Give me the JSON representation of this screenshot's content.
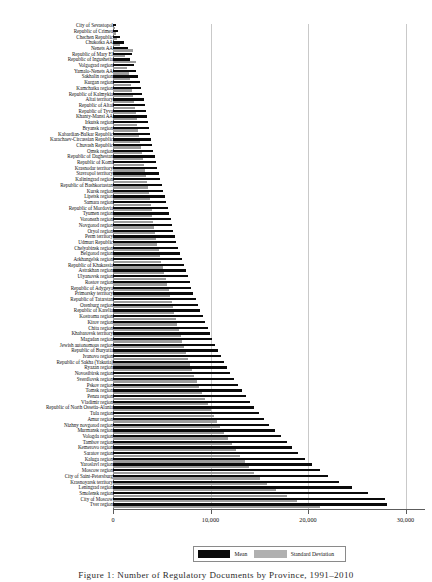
{
  "figure": {
    "caption": "Figure 1:     Number  of Regulatory  Documents by Province, 1991–2010"
  },
  "legend": {
    "position": "bottom-center",
    "items": [
      {
        "label": "Mean",
        "color": "#0a0a0a",
        "name": "legend-item-mean"
      },
      {
        "label": "Standard Deviation",
        "color": "#b0b0b0",
        "name": "legend-item-standard-deviation"
      }
    ]
  },
  "chart_data": {
    "type": "bar",
    "orientation": "horizontal",
    "title": "",
    "xlabel": "",
    "ylabel": "",
    "xlim": [
      0,
      32000
    ],
    "xticks": [
      0,
      10000,
      20000,
      30000
    ],
    "xtick_labels": [
      "0",
      "10,000",
      "20,000",
      "30,000"
    ],
    "grid": "vertical",
    "series": [
      {
        "name": "Mean",
        "color": "#0a0a0a"
      },
      {
        "name": "Standard Deviation",
        "color": "#9c9c9c"
      }
    ],
    "categories": [
      "City of Sevastopol",
      "Republic of Crimea",
      "Chechen Republic",
      "Chukotka  AA",
      "Nenets  AA",
      "Republic of Mary El",
      "Republic of Ingushetia",
      "Volgograd region",
      "Yamalo-Nenets AA",
      "Sakhalin region",
      "Kurgan region",
      "Kamchatka region",
      "Republic of Kalmykia",
      "Altai territory",
      "Republic of Altai",
      "Republic of Tyva",
      "Khanty-Mansi  AA",
      "Irkutsk region",
      "Bryansk region",
      "Kabardian-Balkar Republic",
      "Karachaev-Circassian Republic",
      "Chuvash Republic",
      "Omsk region",
      "Republic of Daghestan",
      "Republic of Komi",
      "Krasnodar territory",
      "Stavropol territory",
      "Kaliningrad region",
      "Republic of Bashkortastan",
      "Kursk region",
      "Lipetsk region",
      "Samara region",
      "Republic of Mordovia",
      "Tyumen region",
      "Voronezh region",
      "Novgorod region",
      "Oryol region",
      "Perm territory",
      "Udmurt Republic",
      "Chelyabinsk region",
      "Belgorod region",
      "Arkhangelsk region",
      "Republic of Khakassia",
      "Astrakhan region",
      "Ulyanovsk region",
      "Rostov region",
      "Republic of Adygeya",
      "Primorsky territory",
      "Republic of Tatarstan",
      "Orenburg region",
      "Republic of Karelia",
      "Kostroma region",
      "Kirov region",
      "Chita region",
      "Khabarovsk territory",
      "Magadan region",
      "Jewish autonomous region",
      "Republic of Buryatia",
      "Ivanovo region",
      "Republic of Sakha (Yakutia)",
      "Ryazan region",
      "Novosibirsk region",
      "Sverdlovsk region",
      "Pskov region",
      "Tomsk region",
      "Penza region",
      "Vladimir region",
      "Republic of North Ossetia-Alania",
      "Tula region",
      "Amur region",
      "Nizhny novgorod region",
      "Murmansk region",
      "Vologda region",
      "Tambov region",
      "Kemerovo region",
      "Saratov region",
      "Kaluga region",
      "Yaroslavl region",
      "Moscow region",
      "City of Saint-Petersburg",
      "Krasnoyarsk territory",
      "Leningrad region",
      "Smolensk region",
      "City of Moscow",
      "Tver region"
    ],
    "values": {
      "Mean": [
        320,
        520,
        700,
        1150,
        1500,
        1900,
        1750,
        2150,
        2400,
        2600,
        2750,
        2900,
        3000,
        3150,
        3300,
        3400,
        3500,
        3600,
        3700,
        3800,
        3900,
        4000,
        4150,
        4300,
        4400,
        4550,
        4700,
        4850,
        5000,
        5150,
        5300,
        5450,
        5600,
        5750,
        5900,
        6050,
        6200,
        6350,
        6500,
        6700,
        6900,
        7050,
        7250,
        7450,
        7650,
        7850,
        8050,
        8250,
        8500,
        8700,
        8950,
        9200,
        9450,
        9700,
        9950,
        10200,
        10500,
        10800,
        11100,
        11400,
        11700,
        12000,
        12400,
        12800,
        13200,
        13600,
        14000,
        14500,
        15000,
        15500,
        16000,
        16600,
        17200,
        17800,
        18400,
        19000,
        19700,
        20400,
        21200,
        22100,
        23200,
        24500,
        26200,
        27900,
        28100
      ],
      "Standard Deviation": [
        180,
        330,
        420,
        700,
        2050,
        1250,
        2400,
        1400,
        1600,
        1750,
        1850,
        1950,
        2050,
        2150,
        2250,
        2350,
        2450,
        2500,
        2600,
        2700,
        2750,
        2850,
        2950,
        3050,
        3150,
        3250,
        3350,
        3450,
        3550,
        3650,
        3750,
        3850,
        3950,
        4050,
        4150,
        4250,
        4350,
        4450,
        4550,
        4700,
        4850,
        4950,
        5100,
        5250,
        5400,
        5550,
        5700,
        5850,
        6000,
        6150,
        6300,
        6450,
        6600,
        6800,
        6950,
        7100,
        7300,
        7500,
        7700,
        7900,
        8100,
        8300,
        8600,
        8850,
        9100,
        9400,
        9700,
        10000,
        10350,
        10700,
        11000,
        11400,
        11800,
        12200,
        12600,
        13000,
        13500,
        13950,
        14500,
        15100,
        15800,
        16700,
        17800,
        18900,
        21200
      ]
    }
  }
}
